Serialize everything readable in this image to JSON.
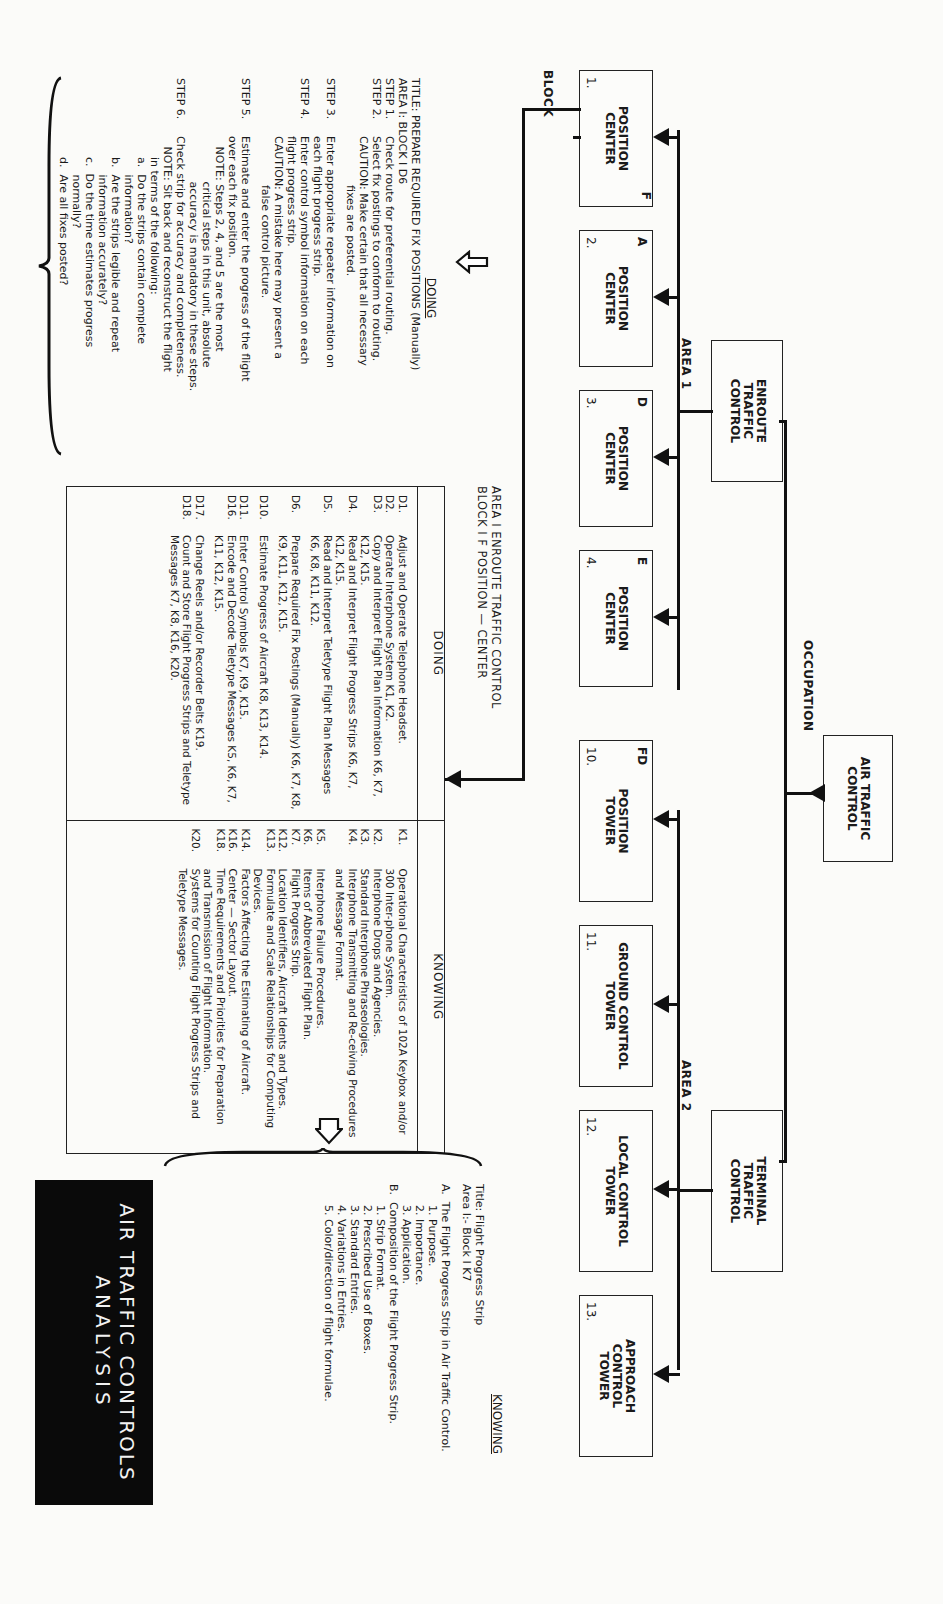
{
  "org_chart": {
    "occupation_label": "OCCUPATION",
    "root": "AIR TRAFFIC CONTROL",
    "areas": [
      {
        "label": "AREA 1",
        "name": "ENROUTE TRAFFIC CONTROL"
      },
      {
        "label": "AREA 2",
        "name": "TERMINAL TRAFFIC CONTROL"
      }
    ],
    "block_label": "BLOCK",
    "blocks": [
      {
        "letter": "F",
        "num": "1.",
        "l1": "POSITION",
        "l2": "CENTER",
        "l3": ""
      },
      {
        "letter": "A",
        "num": "2.",
        "l1": "POSITION",
        "l2": "CENTER",
        "l3": ""
      },
      {
        "letter": "D",
        "num": "3.",
        "l1": "POSITION",
        "l2": "CENTER",
        "l3": ""
      },
      {
        "letter": "E",
        "num": "4.",
        "l1": "POSITION",
        "l2": "CENTER",
        "l3": ""
      },
      {
        "letter": "FD",
        "num": "10.",
        "l1": "POSITION",
        "l2": "TOWER",
        "l3": ""
      },
      {
        "letter": "",
        "num": "11.",
        "l1": "GROUND CONTROL",
        "l2": "TOWER",
        "l3": ""
      },
      {
        "letter": "",
        "num": "12.",
        "l1": "LOCAL CONTROL",
        "l2": "TOWER",
        "l3": ""
      },
      {
        "letter": "",
        "num": "13.",
        "l1": "APPROACH",
        "l2": "CONTROL",
        "l3": "TOWER"
      }
    ]
  },
  "doing_detail": {
    "heading": "DOING",
    "title_line": "TITLE: PREPARE REQUIRED FIX POSITIONS (Manually)",
    "area_line": "AREA I: BLOCK I D6",
    "steps": [
      {
        "k": "STEP 1.",
        "t": "Check route for preferential routing."
      },
      {
        "k": "STEP 2.",
        "t": "Select fix postings to conform to routing."
      },
      {
        "k": "",
        "t": "CAUTION: Make certain that all necessary"
      },
      {
        "k": "",
        "t": "              fixes are posted."
      },
      {
        "k": "",
        "t": ""
      },
      {
        "k": "STEP 3.",
        "t": "Enter appropriate repeater information on"
      },
      {
        "k": "",
        "t": "each flight progress strip."
      },
      {
        "k": "STEP 4.",
        "t": "Enter control symbol information on each"
      },
      {
        "k": "",
        "t": "flight progress strip."
      },
      {
        "k": "",
        "t": "CAUTION: A mistake here may present a"
      },
      {
        "k": "",
        "t": "              false control picture."
      },
      {
        "k": "",
        "t": ""
      },
      {
        "k": "STEP 5.",
        "t": "Estimate and enter the progress of the flight"
      },
      {
        "k": "",
        "t": "over each fix position."
      },
      {
        "k": "",
        "t": "   NOTE: Steps 2, 4, and 5 are the most"
      },
      {
        "k": "",
        "t": "             critical steps in this unit, absolute"
      },
      {
        "k": "",
        "t": "             accuracy is mandatory in these steps."
      },
      {
        "k": "STEP 6.",
        "t": "Check strip for accuracy and completeness."
      },
      {
        "k": "",
        "t": "   NOTE: Sit back and reconstruct the flight"
      },
      {
        "k": "",
        "t": "      in terms of the following:"
      },
      {
        "k": "",
        "t": "      a.  Do the strips contain complete"
      },
      {
        "k": "",
        "t": "           information?"
      },
      {
        "k": "",
        "t": "      b.  Are the strips legible and repeat"
      },
      {
        "k": "",
        "t": "           information accurately?"
      },
      {
        "k": "",
        "t": "      c.  Do the time estimates progress"
      },
      {
        "k": "",
        "t": "           normally?"
      },
      {
        "k": "",
        "t": "      d.  Are all fixes posted?"
      }
    ]
  },
  "main_table": {
    "caption_line1": "AREA  I  ENROUTE TRAFFIC CONTROL",
    "caption_line2": "BLOCK I   F POSITION — CENTER",
    "doing_header": "DOING",
    "knowing_header": "KNOWING",
    "doing": [
      {
        "id": "D1.",
        "text": "Adjust and Operate Telephone Headset."
      },
      {
        "id": "D2.",
        "text": "Operate Interphone System K1, K2."
      },
      {
        "id": "D3.",
        "text": "Copy and Interpret Flight Plan Information K6, K7, K12, K15."
      },
      {
        "id": "D4.",
        "text": "Read and Interpret Flight Progress Strips K6, K7, K12, K15."
      },
      {
        "id": "D5.",
        "text": "Read and Interpret Teletype Flight Plan Messages K6, K8, K11, K12."
      },
      {
        "id": "D6.",
        "text": "Prepare Required Fix Postings (Manually) K6, K7, K8, K9, K11, K12, K15."
      },
      {
        "id": "D10.",
        "text": "Estimate Progress of Aircraft K8, K13, K14."
      },
      {
        "id": "D11.",
        "text": "Enter Control Symbols K7, K9, K15."
      },
      {
        "id": "D16.",
        "text": "Encode and Decode Teletype Messages K5, K6, K7, K11, K12, K15."
      },
      {
        "id": "D17.",
        "text": "Change Reels and/or Recorder Belts K19."
      },
      {
        "id": "D18.",
        "text": "Count and Store Flight Progress Strips and Teletype Messages K7, K8, K16, K20."
      }
    ],
    "knowing": [
      {
        "id": "K1.",
        "text": "Operational Characteristics of 102A Keybox and/or 300 Inter-phone System."
      },
      {
        "id": "K2.",
        "text": "Interphone Drops and Agencies."
      },
      {
        "id": "K3.",
        "text": "Standard Interphone Phraseologies."
      },
      {
        "id": "K4.",
        "text": "Interphone Transmitting and Re-ceiving Procedures and Message Format."
      },
      {
        "id": "K5.",
        "text": "Interphone Failure Procedures."
      },
      {
        "id": "K6.",
        "text": "Items of Abbreviated Flight Plan."
      },
      {
        "id": "K7.",
        "text": "Flight Progress Strip."
      },
      {
        "id": "K12.",
        "text": "Location Identifiers, Aircraft Idents and Types."
      },
      {
        "id": "K13.",
        "text": "Formulate and Scale Relationships for Computing Devices."
      },
      {
        "id": "K14.",
        "text": "Factors Affecting the Estimating of Aircraft."
      },
      {
        "id": "K16.",
        "text": "Center — Sector Layout."
      },
      {
        "id": "K18.",
        "text": "Time Requirements and Priorities for Preparation and Transmission of Flight Information."
      },
      {
        "id": "K20.",
        "text": "Systems for Counting Flight Progress Strips and Teletype Messages."
      }
    ]
  },
  "knowing_detail": {
    "heading": "KNOWING",
    "title_line": "Title:  Flight Progress Strip",
    "area_line": "Area I:- Block I  K7",
    "lines": [
      "A.  The Flight Progress Strip in Air Traffic Control.",
      "      1. Purpose.",
      "      2. Importance.",
      "      3. Application.",
      "B.  Composition of the Flight Progress Strip.",
      "      1. Strip Format.",
      "      2. Prescribed Use of Boxes.",
      "      3. Standard Entries.",
      "      4. Variations in Entries.",
      "      5. Color/direction of flight formulae."
    ]
  },
  "title_block": {
    "line1": "AIR TRAFFIC CONTROLS",
    "line2": "ANALYSIS"
  }
}
